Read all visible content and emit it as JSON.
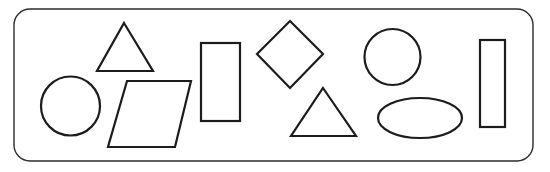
{
  "figure": {
    "width": 550,
    "height": 172,
    "background_color": "#ffffff"
  },
  "panel": {
    "name": "rounded-rectangle-panel",
    "x": 14,
    "y": 9,
    "width": 519,
    "height": 152,
    "corner_radius": 16,
    "stroke_color": "#2b2b2b",
    "stroke_width": 1.4,
    "fill": "none"
  },
  "style": {
    "shape_stroke_color": "#1c1c1c",
    "shape_stroke_width": 2.2,
    "shape_fill": "none"
  },
  "shapes": [
    {
      "id": "circle-small-left",
      "label": "Circle",
      "type": "circle",
      "cx": 70.5,
      "cy": 106,
      "r": 29.5
    },
    {
      "id": "triangle-upper-left",
      "label": "Triangle",
      "type": "triangle",
      "points": "124,23 153,71 97,71"
    },
    {
      "id": "parallelogram",
      "label": "Parallelogram",
      "type": "parallelogram",
      "points": "127,81 191,81 175,147 108,147"
    },
    {
      "id": "rectangle-tall-left",
      "label": "Rectangle",
      "type": "rectangle",
      "x": 201,
      "y": 43,
      "width": 39,
      "height": 78
    },
    {
      "id": "diamond",
      "label": "Diamond",
      "type": "diamond",
      "points": "290,21 323,54 290,88 257,54"
    },
    {
      "id": "triangle-lower-right",
      "label": "Triangle",
      "type": "triangle",
      "points": "323,88 356,136 291,136"
    },
    {
      "id": "circle-upper-right",
      "label": "Circle",
      "type": "circle",
      "cx": 392.5,
      "cy": 57,
      "r": 28
    },
    {
      "id": "ellipse",
      "label": "Ellipse",
      "type": "ellipse",
      "cx": 420,
      "cy": 118,
      "rx": 42,
      "ry": 20
    },
    {
      "id": "rectangle-tall-right",
      "label": "Rectangle",
      "type": "rectangle",
      "x": 480,
      "y": 40,
      "width": 25,
      "height": 87
    }
  ]
}
